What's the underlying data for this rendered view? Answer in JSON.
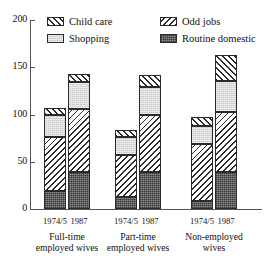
{
  "chart_data": {
    "type": "bar",
    "subtype": "stacked-bar-grouped",
    "title": "",
    "xlabel": "",
    "ylabel": "",
    "ylim": [
      0,
      200
    ],
    "yticks": [
      0,
      50,
      100,
      150,
      200
    ],
    "ytick_labels": [
      "0",
      "50",
      "100",
      "150",
      "200"
    ],
    "grid": false,
    "legend_position": "top",
    "groups": [
      {
        "label_line1": "Full-time",
        "label_line2": "employed wives",
        "bars": [
          {
            "category": "1974/5",
            "total": 107,
            "segments": [
              {
                "name": "Routine domestic",
                "value": 19
              },
              {
                "name": "Odd jobs",
                "value": 57
              },
              {
                "name": "Shopping",
                "value": 23
              },
              {
                "name": "Child care",
                "value": 8
              }
            ]
          },
          {
            "category": "1987",
            "total": 143,
            "segments": [
              {
                "name": "Routine domestic",
                "value": 39
              },
              {
                "name": "Odd jobs",
                "value": 67
              },
              {
                "name": "Shopping",
                "value": 28
              },
              {
                "name": "Child care",
                "value": 9
              }
            ]
          }
        ]
      },
      {
        "label_line1": "Part-time",
        "label_line2": "employed wives",
        "bars": [
          {
            "category": "1974/5",
            "total": 84,
            "segments": [
              {
                "name": "Routine domestic",
                "value": 13
              },
              {
                "name": "Odd jobs",
                "value": 44
              },
              {
                "name": "Shopping",
                "value": 19
              },
              {
                "name": "Child care",
                "value": 8
              }
            ]
          },
          {
            "category": "1987",
            "total": 142,
            "segments": [
              {
                "name": "Routine domestic",
                "value": 39
              },
              {
                "name": "Odd jobs",
                "value": 60
              },
              {
                "name": "Shopping",
                "value": 30
              },
              {
                "name": "Child care",
                "value": 13
              }
            ]
          }
        ]
      },
      {
        "label_line1": "Non-employed",
        "label_line2": "wives",
        "bars": [
          {
            "category": "1974/5",
            "total": 97,
            "segments": [
              {
                "name": "Routine domestic",
                "value": 9
              },
              {
                "name": "Odd jobs",
                "value": 60
              },
              {
                "name": "Shopping",
                "value": 19
              },
              {
                "name": "Child care",
                "value": 9
              }
            ]
          },
          {
            "category": "1987",
            "total": 163,
            "segments": [
              {
                "name": "Routine domestic",
                "value": 39
              },
              {
                "name": "Odd jobs",
                "value": 64
              },
              {
                "name": "Shopping",
                "value": 32
              },
              {
                "name": "Child care",
                "value": 28
              }
            ]
          }
        ]
      }
    ],
    "series": [
      {
        "name": "Child care",
        "pattern": "diagonal-forward-hatch",
        "color": "#ffffff"
      },
      {
        "name": "Shopping",
        "pattern": "light-stipple",
        "color": "#c9c9c9"
      },
      {
        "name": "Odd jobs",
        "pattern": "diagonal-back-hatch",
        "color": "#ffffff"
      },
      {
        "name": "Routine domestic",
        "pattern": "dark-stipple",
        "color": "#8e8e8e"
      }
    ],
    "legend": [
      {
        "label": "Child care",
        "key": "childcare"
      },
      {
        "label": "Shopping",
        "key": "shopping"
      },
      {
        "label": "Odd jobs",
        "key": "oddjobs"
      },
      {
        "label": "Routine domestic",
        "key": "routine"
      }
    ]
  }
}
